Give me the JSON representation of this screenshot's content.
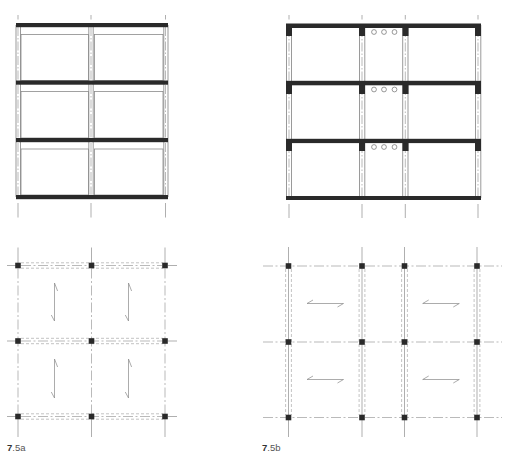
{
  "figures": [
    {
      "id": "7.5a",
      "label_number": "7",
      "label_suffix": ".5a",
      "elevation": {
        "bays": 2,
        "storeys": 3,
        "beam_levels": 4,
        "infill_panels": 6
      },
      "plan": {
        "grid_lines_x": 3,
        "grid_lines_y": 3,
        "columns": 9,
        "slab_span_direction": "vertical",
        "span_symbols": 4
      }
    },
    {
      "id": "7.5b",
      "label_number": "7",
      "label_suffix": ".5b",
      "elevation": {
        "bays": 3,
        "storeys": 3,
        "beam_levels": 4,
        "service_openings_per_floor": 3
      },
      "plan": {
        "grid_lines_x": 4,
        "grid_lines_y": 3,
        "columns": 12,
        "slab_span_direction": "horizontal",
        "span_symbols": 4
      }
    }
  ],
  "colors": {
    "structure": "#2a2a2a",
    "lines": "#8c8c8c",
    "background": "#ffffff"
  }
}
